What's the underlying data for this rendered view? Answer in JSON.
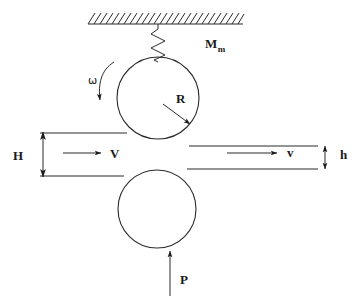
{
  "figure": {
    "background_color": "#ffffff",
    "line_color": "#2b2b2b",
    "text_color": "#1a1a1a",
    "width": 362,
    "height": 299
  },
  "labels": {
    "moment": {
      "base": "M",
      "subscript": "m",
      "meaning": "motor-moment-label",
      "x": 205,
      "y": 48
    },
    "omega": {
      "text": "ω",
      "meaning": "angular-velocity-label",
      "x": 88,
      "y": 84
    },
    "radius": {
      "text": "R",
      "meaning": "roll-radius-label",
      "x": 176,
      "y": 103
    },
    "entry_thickness": {
      "text": "H",
      "meaning": "entry-strip-thickness-label",
      "x": 17,
      "y": 159
    },
    "exit_thickness": {
      "text": "h",
      "meaning": "exit-strip-thickness-label",
      "x": 342,
      "y": 159
    },
    "entry_velocity": {
      "text": "V",
      "meaning": "entry-velocity-label",
      "x": 111,
      "y": 158
    },
    "exit_velocity": {
      "text": "v",
      "meaning": "exit-velocity-label",
      "x": 287,
      "y": 156
    },
    "force": {
      "text": "P",
      "meaning": "roll-separating-force-label",
      "x": 180,
      "y": 284
    }
  },
  "geometry": {
    "ceiling": {
      "line_y": 24,
      "line_x1": 88,
      "line_x2": 243,
      "hatch_count": 25,
      "hatch_length": 11
    },
    "spring": {
      "x_center": 158,
      "top_y": 24,
      "bottom_y": 60,
      "zigzag_count": 5,
      "amplitude": 7
    },
    "upper_roll": {
      "cx": 158,
      "cy": 98,
      "r": 41
    },
    "lower_roll": {
      "cx": 157,
      "cy": 209,
      "r": 39
    },
    "strip_lines": {
      "entry_top_y": 133,
      "entry_bottom_y": 176,
      "exit_top_y": 146,
      "exit_bottom_y": 169,
      "entry_x1": 40,
      "entry_x2": 128,
      "exit_x1": 188,
      "exit_x2": 318
    },
    "h_arrow": {
      "x": 43,
      "y1": 131,
      "y2": 177
    },
    "small_h_arrow": {
      "x": 325,
      "y1": 145,
      "y2": 170
    },
    "entry_velocity_arrow": {
      "y": 153,
      "x1": 63,
      "x2": 103
    },
    "exit_velocity_arrow": {
      "y": 153,
      "x1": 227,
      "x2": 278
    },
    "force_arrow": {
      "x": 170,
      "y_from": 296,
      "y_to": 250
    },
    "omega_arrow": {
      "description": "counter-clockwise curved arrow on upper-left of upper roll"
    },
    "radius_leader": {
      "x1": 163,
      "y1": 104,
      "x2": 190,
      "y2": 124
    }
  }
}
